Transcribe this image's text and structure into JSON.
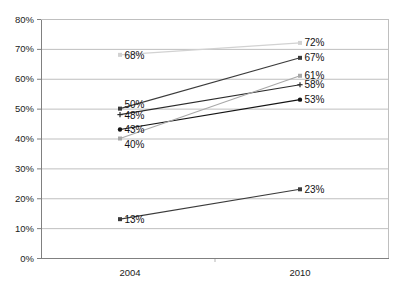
{
  "chart_data": {
    "type": "line",
    "title": "",
    "subtitle": "",
    "xlabel": "",
    "ylabel": "",
    "categories": [
      "2004",
      "2010"
    ],
    "x": [
      2004,
      2010
    ],
    "ylim": [
      0,
      80
    ],
    "ytick_step": 10,
    "grid": true,
    "legend": "none",
    "value_labels_shown": true,
    "value_label_suffix": "%",
    "yticks": [
      "0%",
      "10%",
      "20%",
      "30%",
      "40%",
      "50%",
      "60%",
      "70%",
      "80%"
    ],
    "ytick_values": [
      0,
      10,
      20,
      30,
      40,
      50,
      60,
      70,
      80
    ],
    "series": [
      {
        "name": "series-1",
        "values": [
          68,
          72
        ],
        "labels": [
          "68%",
          "72%"
        ],
        "color": "#d2d2d2",
        "marker": "square"
      },
      {
        "name": "series-2",
        "values": [
          50,
          67
        ],
        "labels": [
          "50%",
          "67%"
        ],
        "color": "#3b3b3b",
        "marker": "square"
      },
      {
        "name": "series-3",
        "values": [
          48,
          58
        ],
        "labels": [
          "48%",
          "58%"
        ],
        "color": "#2b2b2b",
        "marker": "cross"
      },
      {
        "name": "series-4",
        "values": [
          43,
          53
        ],
        "labels": [
          "43%",
          "53%"
        ],
        "color": "#141414",
        "marker": "circle"
      },
      {
        "name": "series-5",
        "values": [
          40,
          61
        ],
        "labels": [
          "40%",
          "61%"
        ],
        "color": "#a8a8a8",
        "marker": "square"
      },
      {
        "name": "series-6",
        "values": [
          13,
          23
        ],
        "labels": [
          "13%",
          "23%"
        ],
        "color": "#3b3b3b",
        "marker": "square"
      }
    ],
    "colors": {
      "axis": "#808080",
      "grid": "#bfbfbf",
      "background": "#ffffff",
      "text": "#1b1b1b"
    }
  }
}
